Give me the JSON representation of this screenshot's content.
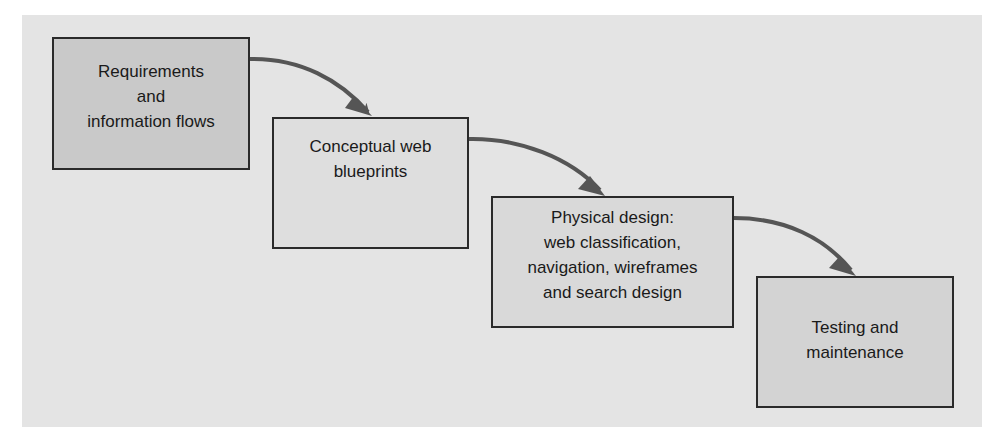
{
  "diagram": {
    "type": "process-flow",
    "colors": {
      "panel_background": "#e4e4e4",
      "arrow": "#555555",
      "border": "#2a2a2a"
    },
    "steps": [
      {
        "id": "step-1",
        "lines": [
          "Requirements",
          "and",
          "information flows"
        ],
        "fill": "#c9c9c9"
      },
      {
        "id": "step-2",
        "lines": [
          "Conceptual web",
          "blueprints"
        ],
        "fill": "#dedede"
      },
      {
        "id": "step-3",
        "lines": [
          "Physical design:",
          "web classification,",
          "navigation, wireframes",
          "and search design"
        ],
        "fill": "#d9d9d9"
      },
      {
        "id": "step-4",
        "lines": [
          "Testing and",
          "maintenance"
        ],
        "fill": "#d3d3d3"
      }
    ],
    "connections": [
      {
        "from": "step-1",
        "to": "step-2"
      },
      {
        "from": "step-2",
        "to": "step-3"
      },
      {
        "from": "step-3",
        "to": "step-4"
      }
    ]
  }
}
